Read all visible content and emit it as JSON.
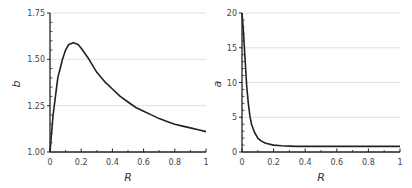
{
  "chart_data": [
    {
      "type": "line",
      "title": "",
      "xlabel": "R",
      "ylabel": "b",
      "xlim": [
        0,
        1
      ],
      "ylim": [
        1.0,
        1.75
      ],
      "xticks": [
        "0",
        "0.2",
        "0.4",
        "0.6",
        "0.8",
        "1"
      ],
      "yticks": [
        "1.00",
        "1.25",
        "1.50",
        "1.75"
      ],
      "grid": "horizontal",
      "series": [
        {
          "name": "b",
          "x": [
            0.0,
            0.02,
            0.05,
            0.08,
            0.1,
            0.12,
            0.15,
            0.18,
            0.2,
            0.25,
            0.3,
            0.35,
            0.4,
            0.45,
            0.5,
            0.55,
            0.6,
            0.65,
            0.7,
            0.75,
            0.8,
            0.85,
            0.9,
            0.95,
            1.0
          ],
          "values": [
            1.0,
            1.2,
            1.4,
            1.5,
            1.55,
            1.58,
            1.59,
            1.58,
            1.56,
            1.5,
            1.43,
            1.38,
            1.34,
            1.3,
            1.27,
            1.24,
            1.22,
            1.2,
            1.18,
            1.165,
            1.15,
            1.14,
            1.13,
            1.12,
            1.11
          ]
        }
      ]
    },
    {
      "type": "line",
      "title": "",
      "xlabel": "R",
      "ylabel": "a",
      "xlim": [
        0,
        1
      ],
      "ylim": [
        0,
        20
      ],
      "xticks": [
        "0",
        "0.2",
        "0.4",
        "0.6",
        "0.8",
        "1"
      ],
      "yticks": [
        "0",
        "5",
        "10",
        "15",
        "20"
      ],
      "grid": "horizontal",
      "series": [
        {
          "name": "a",
          "x": [
            0.0,
            0.01,
            0.02,
            0.03,
            0.04,
            0.05,
            0.06,
            0.08,
            0.1,
            0.12,
            0.15,
            0.2,
            0.25,
            0.3,
            0.35,
            0.4,
            0.5,
            0.6,
            0.7,
            0.8,
            0.9,
            1.0
          ],
          "values": [
            20,
            17,
            13,
            9.5,
            7,
            5.2,
            4.0,
            2.8,
            2.0,
            1.6,
            1.25,
            1.0,
            0.9,
            0.85,
            0.8,
            0.8,
            0.8,
            0.8,
            0.8,
            0.8,
            0.8,
            0.8
          ]
        }
      ]
    }
  ],
  "left_chart": {
    "ylabel": "b",
    "xlabel": "R",
    "yticks": [
      "1.75",
      "1.50",
      "1.25",
      "1.00"
    ],
    "xticks": [
      "0",
      "0.2",
      "0.4",
      "0.6",
      "0.8",
      "1"
    ]
  },
  "right_chart": {
    "ylabel": "a",
    "xlabel": "R",
    "yticks": [
      "20",
      "15",
      "10",
      "5",
      "0"
    ],
    "xticks": [
      "0",
      "0.2",
      "0.4",
      "0.6",
      "0.8",
      "1"
    ]
  },
  "colors": {
    "line": "#222222",
    "grid": "#d8d8d8",
    "axis": "#222222"
  }
}
